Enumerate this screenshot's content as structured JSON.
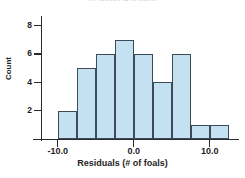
{
  "chart_data": {
    "type": "bar",
    "title": "Residuals (# of foals)",
    "xlabel": "Residuals (# of foals)",
    "ylabel": "Count",
    "categories": [
      "-10.0 to -7.5",
      "-7.5 to -5.0",
      "-5.0 to -2.5",
      "-2.5 to 0.0",
      "0.0 to 2.5",
      "2.5 to 5.0",
      "5.0 to 7.5",
      "7.5 to 10.0",
      "10.0 to 12.5"
    ],
    "bin_edges": [
      -10.0,
      -7.5,
      -5.0,
      -2.5,
      0.0,
      2.5,
      5.0,
      7.5,
      10.0,
      12.5
    ],
    "bin_width": 2.5,
    "values": [
      2,
      5,
      6,
      7,
      6,
      4,
      6,
      1,
      1
    ],
    "ylim": [
      0,
      8.6
    ],
    "xlim": [
      -12.2,
      13.6
    ],
    "ytick_labels": [
      "8",
      "6",
      "4",
      "2"
    ],
    "ytick_values": [
      8,
      6,
      4,
      2
    ],
    "xtick_labels": [
      "-10.0",
      "0.0",
      "10.0"
    ],
    "xtick_values": [
      -10.0,
      0.0,
      10.0
    ],
    "grid": false,
    "legend": false,
    "bar_fill_color": "#c3e1f0",
    "bar_edge_color": "#3c4b55",
    "axis_color": "#2b2b2b"
  }
}
